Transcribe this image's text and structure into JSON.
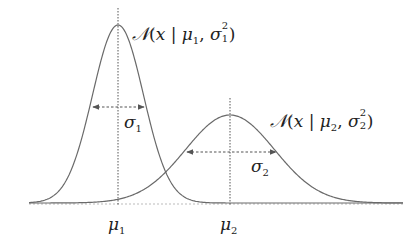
{
  "diagram": {
    "colors": {
      "curve": "#6a6a6a",
      "guide": "#555555",
      "text": "#222222",
      "background": "#ffffff"
    },
    "baseline": {
      "y": 203,
      "x_start": 29,
      "x_end": 403
    },
    "gaussians": [
      {
        "id": "g1",
        "mean_label": "μ",
        "mean_sub": "1",
        "sigma_label": "σ",
        "sigma_sub": "1",
        "formula": {
          "N": "𝒩",
          "open": "(",
          "x": "x",
          "bar": " | ",
          "mu": "μ",
          "mu_sub": "1",
          "comma": ", ",
          "sigma": "σ",
          "sigma_sup": "2",
          "sigma_sub": "1",
          "close": ")"
        },
        "mean_x": 118,
        "peak_y": 25,
        "sigma_px": 25.5,
        "sigma_arrow": {
          "y": 107,
          "x1": 93,
          "x2": 144
        }
      },
      {
        "id": "g2",
        "mean_label": "μ",
        "mean_sub": "2",
        "sigma_label": "σ",
        "sigma_sub": "2",
        "formula": {
          "N": "𝒩",
          "open": "(",
          "x": "x",
          "bar": " | ",
          "mu": "μ",
          "mu_sub": "2",
          "comma": ", ",
          "sigma": "σ",
          "sigma_sup": "2",
          "sigma_sub": "2",
          "close": ")"
        },
        "mean_x": 230,
        "peak_y": 115,
        "sigma_px": 44.5,
        "sigma_arrow": {
          "y": 152,
          "x1": 187,
          "x2": 276
        }
      }
    ]
  }
}
